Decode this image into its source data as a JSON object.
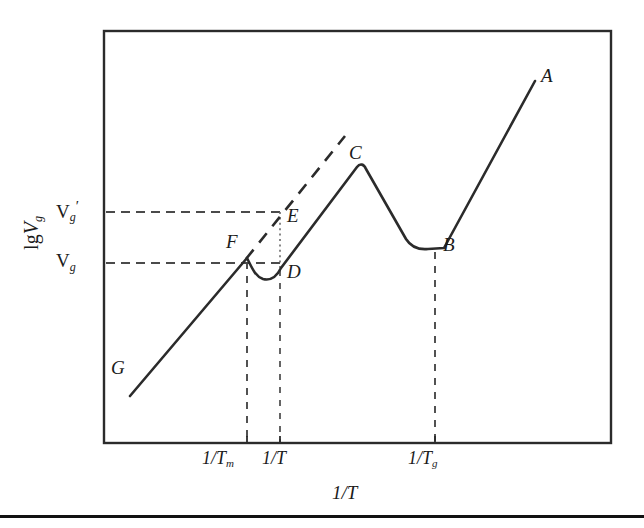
{
  "figure": {
    "background_color": "#ffffff",
    "ink_color": "#2b2b2b",
    "frame": {
      "x": 104,
      "y": 31,
      "width": 507,
      "height": 412
    },
    "bottom_rule_y": 515
  },
  "axes": {
    "y_axis_title_prefix": "lg",
    "y_axis_title_var": "V",
    "y_axis_title_sub": "g",
    "x_axis_title_text": "1/T",
    "y_ticks": [
      {
        "id": "vg-prime",
        "label_var": "V",
        "label_sub": "g",
        "label_sup": "′",
        "y": 212
      },
      {
        "id": "vg",
        "label_var": "V",
        "label_sub": "g",
        "label_sup": "",
        "y": 263
      }
    ],
    "x_ticks": [
      {
        "id": "inv-tm",
        "text": "1/T",
        "sub": "m",
        "x": 247
      },
      {
        "id": "inv-t",
        "text": "1/T",
        "sub": "",
        "x": 280
      },
      {
        "id": "inv-tg",
        "text": "1/T",
        "sub": "g",
        "x": 435
      }
    ]
  },
  "chart_data": {
    "type": "line",
    "title": "",
    "xlabel": "1/T",
    "ylabel": "lg Vg",
    "grid": false,
    "legend": "none",
    "axis_ranges": {
      "x_pixels": [
        104,
        611
      ],
      "y_pixels": [
        31,
        443
      ]
    },
    "annotations": [
      {
        "label": "A",
        "x": 535,
        "y": 80,
        "role": "upper-right-end-of-curve"
      },
      {
        "label": "B",
        "x": 435,
        "y": 248,
        "role": "second-local-minimum"
      },
      {
        "label": "C",
        "x": 357,
        "y": 166,
        "role": "global-peak"
      },
      {
        "label": "D",
        "x": 280,
        "y": 267,
        "role": "first-local-minimum"
      },
      {
        "label": "E",
        "x": 280,
        "y": 212,
        "role": "extrapolated-value-at-1/T"
      },
      {
        "label": "F",
        "x": 247,
        "y": 258,
        "role": "melting-point-kink"
      },
      {
        "label": "G",
        "x": 130,
        "y": 395,
        "role": "lower-left-end-of-curve"
      }
    ],
    "point_labels": [
      {
        "id": "label-a",
        "text": "A",
        "x": 541,
        "y": 66
      },
      {
        "id": "label-b",
        "text": "B",
        "x": 443,
        "y": 235
      },
      {
        "id": "label-c",
        "text": "C",
        "x": 349,
        "y": 143
      },
      {
        "id": "label-d",
        "text": "D",
        "x": 287,
        "y": 262
      },
      {
        "id": "label-e",
        "text": "E",
        "x": 287,
        "y": 206
      },
      {
        "id": "label-f",
        "text": "F",
        "x": 226,
        "y": 232
      },
      {
        "id": "label-g",
        "text": "G",
        "x": 111,
        "y": 358
      }
    ],
    "curve_path": "M 130 396 L 247 258 C 252 268 255 276 263 279 C 271 281 277 276 281 268 L 357 167 C 360 163 364 164 366 169 L 406 239 C 411 247 418 250 428 249 L 444 248 L 535 81",
    "dashed_extrapolation_path": "M 246 259 L 345 136",
    "dotted_drop_path": "M 280 212 L 280 268",
    "horizontal_reference_lines": [
      {
        "id": "vg-prime-line",
        "x1": 106,
        "y1": 212,
        "x2": 281,
        "y2": 212
      },
      {
        "id": "vg-line",
        "x1": 106,
        "y1": 263,
        "x2": 283,
        "y2": 263
      }
    ],
    "vertical_reference_lines": [
      {
        "id": "tm-drop",
        "x": 247,
        "y1": 262,
        "y2": 443
      },
      {
        "id": "t-drop",
        "x": 280,
        "y1": 270,
        "y2": 443
      },
      {
        "id": "tg-drop",
        "x": 435,
        "y1": 252,
        "y2": 443
      }
    ]
  },
  "tick_marks": {
    "x": [
      {
        "id": "tick-tm",
        "x": 247
      },
      {
        "id": "tick-t",
        "x": 280
      },
      {
        "id": "tick-tg",
        "x": 435
      }
    ]
  },
  "x_tick_label_positions": [
    {
      "id": "xlab-tm",
      "left": 202,
      "top": 449
    },
    {
      "id": "xlab-t",
      "left": 262,
      "top": 449
    },
    {
      "id": "xlab-tg",
      "left": 408,
      "top": 449
    }
  ],
  "x_axis_title_position": {
    "left": 332,
    "top": 483
  },
  "y_tick_label_positions": [
    {
      "id": "ylab-vgp",
      "left": 56,
      "top": 199
    },
    {
      "id": "ylab-vg",
      "left": 56,
      "top": 251
    }
  ]
}
